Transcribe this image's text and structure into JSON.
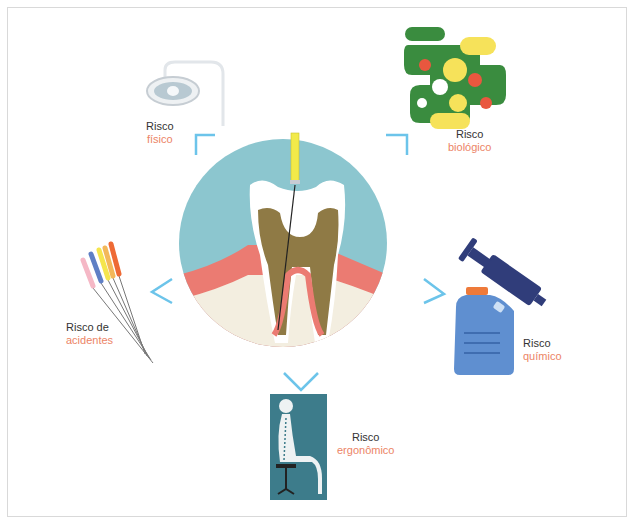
{
  "colors": {
    "accent_blue": "#6cc4ea",
    "label_orange": "#ec8466",
    "circle_bg": "#8cc6cf",
    "gum": "#eb7b72",
    "bone": "#f3eee0",
    "pulp": "#8f7a45"
  },
  "risks": [
    {
      "id": "fisico",
      "line1": "Risco",
      "line2": "físico",
      "icon": "dental-lamp-icon"
    },
    {
      "id": "biologico",
      "line1": "Risco",
      "line2": "biológico",
      "icon": "microorganisms-icon"
    },
    {
      "id": "acidentes",
      "line1": "Risco de",
      "line2": "acidentes",
      "icon": "endodontic-files-icon"
    },
    {
      "id": "quimico",
      "line1": "Risco",
      "line2": "químico",
      "icon": "chemical-container-syringe-icon"
    },
    {
      "id": "ergonomico",
      "line1": "Risco",
      "line2": "ergonômico",
      "icon": "seated-posture-icon"
    }
  ],
  "center": {
    "icon": "tooth-root-canal-icon"
  }
}
